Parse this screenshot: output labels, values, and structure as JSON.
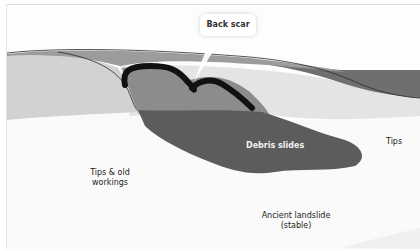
{
  "diagram": {
    "type": "landslide-cross-section",
    "callout": {
      "label": "Back scar"
    },
    "labels": {
      "debris_slides": "Debris slides",
      "tips_right": "Tips",
      "tips_old_line1": "Tips & old",
      "tips_old_line2": "workings",
      "ancient_line1": "Ancient landslide",
      "ancient_line2": "(stable)"
    },
    "colors": {
      "background": "#ffffff",
      "upper_ground_left": "#d3d3d3",
      "upper_ground_band": "#9e9e9e",
      "right_dark_band": "#6e6e6e",
      "middle_light_layer": "#e6e6e6",
      "lower_pale_layer": "#f4f4f4",
      "slide_body": "#8a8a8a",
      "debris_tongue": "#5e5e5e",
      "back_scar": "#111111"
    }
  }
}
